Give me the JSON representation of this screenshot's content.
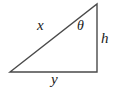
{
  "figure": {
    "kind": "right-triangle-diagram",
    "background_color": "#ffffff",
    "stroke_color": "#4a4a4a",
    "text_color": "#1a1a1a",
    "labels": {
      "hypotenuse": "x",
      "base": "y",
      "vertical_side": "h",
      "angle": "θ"
    },
    "geometry": {
      "apex": "97,4",
      "bottom_right": "97,72",
      "bottom_left": "10,72",
      "triangle_points": "97,4 97,72 10,72"
    }
  }
}
